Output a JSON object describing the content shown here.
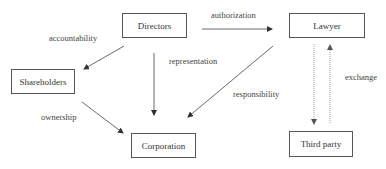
{
  "diagram": {
    "nodes": {
      "directors": "Directors",
      "lawyer": "Lawyer",
      "shareholders": "Shareholders",
      "corporation": "Corporation",
      "third_party": "Third party"
    },
    "edges": {
      "authorization": "authorization",
      "accountability": "accountability",
      "representation": "representation",
      "responsibility": "responsibility",
      "ownership": "ownership",
      "exchange": "exchange"
    },
    "relations": [
      {
        "from": "Directors",
        "to": "Lawyer",
        "label": "authorization"
      },
      {
        "from": "Directors",
        "to": "Shareholders",
        "label": "accountability"
      },
      {
        "from": "Directors",
        "to": "Corporation",
        "label": "representation"
      },
      {
        "from": "Lawyer",
        "to": "Corporation",
        "label": "responsibility"
      },
      {
        "from": "Shareholders",
        "to": "Corporation",
        "label": "ownership"
      },
      {
        "from": "Lawyer",
        "to": "Third party",
        "label": "exchange"
      },
      {
        "from": "Third party",
        "to": "Lawyer",
        "label": "exchange"
      }
    ]
  }
}
